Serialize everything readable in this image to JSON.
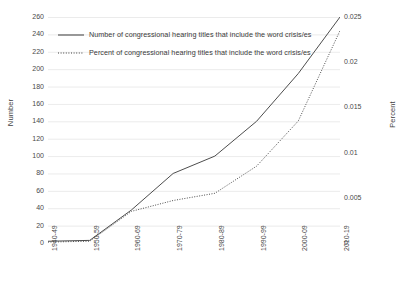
{
  "chart_data": {
    "type": "line",
    "title": "",
    "xlabel": "",
    "categories": [
      "1940-49",
      "1950-59",
      "1960-69",
      "1970-79",
      "1980-89",
      "1990-99",
      "2000-09",
      "2010-19"
    ],
    "series": [
      {
        "name": "Number of congressional hearing titles that include the word crisis/es",
        "axis": "left",
        "style": "solid",
        "color": "#4d4d4d",
        "values": [
          2,
          3,
          38,
          80,
          100,
          140,
          195,
          260
        ]
      },
      {
        "name": "Percent of congressional hearing titles that include the word crisis/es",
        "axis": "right",
        "style": "dotted",
        "color": "#4d4d4d",
        "values": [
          0.0001,
          0.0002,
          0.0035,
          0.0047,
          0.0055,
          0.0085,
          0.0135,
          0.0235
        ]
      }
    ],
    "left_axis": {
      "label": "Number",
      "ylim": [
        0,
        260
      ],
      "step": 20,
      "ticks": [
        "0",
        "20",
        "40",
        "60",
        "80",
        "100",
        "120",
        "140",
        "160",
        "180",
        "200",
        "220",
        "240",
        "260"
      ],
      "tick_values": [
        0,
        20,
        40,
        60,
        80,
        100,
        120,
        140,
        160,
        180,
        200,
        220,
        240,
        260
      ]
    },
    "right_axis": {
      "label": "Percent",
      "ylim": [
        0,
        0.025
      ],
      "step": 0.005,
      "ticks": [
        "0",
        "0.005",
        "0.01",
        "0.015",
        "0.02",
        "0.025"
      ],
      "tick_values": [
        0,
        0.005,
        0.01,
        0.015,
        0.02,
        0.025
      ]
    },
    "grid": {
      "horizontal": true,
      "vertical": false,
      "color": "#e2e2e2"
    },
    "legend": {
      "position": "top-left-inside",
      "entries": [
        "Number of congressional hearing titles that include the word crisis/es",
        "Percent of congressional hearing titles that include the word crisis/es"
      ]
    }
  },
  "legend": {
    "series_1_label": "Number of congressional hearing titles that include the word crisis/es",
    "series_2_label": "Percent of congressional hearing titles that include the word crisis/es"
  },
  "axes": {
    "left_title": "Number",
    "right_title": "Percent"
  }
}
